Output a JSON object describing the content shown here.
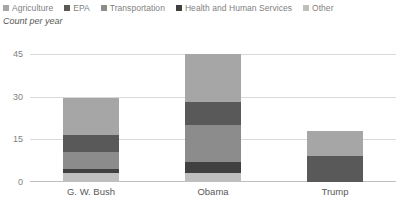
{
  "chart_data": {
    "type": "bar",
    "subtype": "stacked-bar",
    "title": "",
    "xlabel": "",
    "ylabel": "Count per year",
    "ylim": [
      0,
      45
    ],
    "yticks": [
      0,
      15,
      30,
      45
    ],
    "ytick_labels": [
      "0",
      "15",
      "30",
      "45"
    ],
    "grid": true,
    "legend_position": "top",
    "categories": [
      "G. W. Bush",
      "Obama",
      "Trump"
    ],
    "series": [
      {
        "name": "Agriculture",
        "color": "#a6a6a6",
        "values": [
          13.0,
          17.0,
          9.0
        ]
      },
      {
        "name": "EPA",
        "color": "#595959",
        "values": [
          6.0,
          8.0,
          9.0
        ]
      },
      {
        "name": "Transportation",
        "color": "#8c8c8c",
        "values": [
          6.0,
          13.0,
          0.0
        ]
      },
      {
        "name": "Health and Human Services",
        "color": "#404040",
        "values": [
          1.5,
          4.0,
          0.0
        ]
      },
      {
        "name": "Other",
        "color": "#bfbfbf",
        "values": [
          3.0,
          3.0,
          0.0
        ]
      }
    ],
    "stack_order_bottom_up": [
      "Other",
      "Health and Human Services",
      "Transportation",
      "EPA",
      "Agriculture"
    ],
    "totals": [
      29.5,
      45.0,
      18.0
    ]
  },
  "legend": {
    "items": [
      {
        "label": "Agriculture",
        "color": "#a6a6a6"
      },
      {
        "label": "EPA",
        "color": "#595959"
      },
      {
        "label": "Transportation",
        "color": "#8c8c8c"
      },
      {
        "label": "Health and Human Services",
        "color": "#404040"
      },
      {
        "label": "Other",
        "color": "#bfbfbf"
      }
    ]
  },
  "axes": {
    "y_title": "Count per year",
    "y_ticks": [
      "45",
      "30",
      "15",
      "0"
    ],
    "x_categories": [
      "G. W. Bush",
      "Obama",
      "Trump"
    ]
  },
  "colors": {
    "gridline": "#d9d9d9",
    "axis": "#bfbfbf",
    "text": "#595959",
    "legend_text": "#7f7f7f",
    "background": "#ffffff"
  }
}
